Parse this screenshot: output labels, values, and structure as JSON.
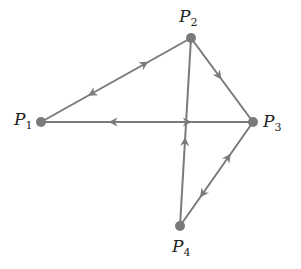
{
  "diagram": {
    "type": "directed-graph",
    "edge_color": "#7a7a7a",
    "node_color": "#7a7a7a",
    "nodes": [
      {
        "id": "P1",
        "label": "P",
        "sub": "1",
        "x": 41,
        "y": 122,
        "lx": 14,
        "ly": 111
      },
      {
        "id": "P2",
        "label": "P",
        "sub": "2",
        "x": 191,
        "y": 38,
        "lx": 179,
        "ly": 8
      },
      {
        "id": "P3",
        "label": "P",
        "sub": "3",
        "x": 253,
        "y": 122,
        "lx": 263,
        "ly": 113
      },
      {
        "id": "P4",
        "label": "P",
        "sub": "4",
        "x": 180,
        "y": 226,
        "lx": 172,
        "ly": 238
      }
    ],
    "edges": [
      {
        "from": "P1",
        "to": "P2",
        "directed": "both"
      },
      {
        "from": "P1",
        "to": "P3",
        "directed": "both"
      },
      {
        "from": "P2",
        "to": "P3",
        "directed": "forward"
      },
      {
        "from": "P4",
        "to": "P2",
        "directed": "forward"
      },
      {
        "from": "P3",
        "to": "P4",
        "directed": "both"
      }
    ]
  }
}
